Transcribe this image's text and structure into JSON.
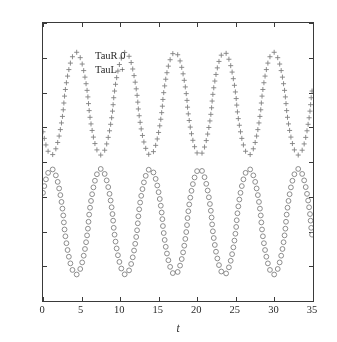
{
  "chart_data": {
    "type": "scatter",
    "title": "",
    "xlabel": "t",
    "ylabel": "",
    "xlim": [
      0,
      35
    ],
    "ylim": [
      -20,
      20
    ],
    "grid": false,
    "legend_position": "top-left",
    "xticks": [
      "0",
      "5",
      "10",
      "15",
      "20",
      "25",
      "30",
      "35"
    ],
    "xtick_values": [
      0,
      5,
      10,
      15,
      20,
      25,
      30,
      35
    ],
    "yticks": [
      "20",
      "15",
      "10",
      "5",
      "0",
      "-5",
      "-10",
      "-15",
      "-20"
    ],
    "ytick_values": [
      20,
      15,
      10,
      5,
      0,
      -5,
      -10,
      -15,
      -20
    ],
    "marker_color": "#808080",
    "axis_color": "#3a3a3a",
    "period": 6.4,
    "series": [
      {
        "name": "TauL",
        "label": "TauL +",
        "marker": "plus",
        "color": "#808080",
        "amplitude_min": 1.0,
        "amplitude_max": 15.8,
        "peaks_t": [
          4.3,
          10.7,
          17.2,
          23.6,
          30.0
        ],
        "troughs_t": [
          1.1,
          7.5,
          13.9,
          20.3,
          26.7,
          33.1
        ],
        "start_value": 5.0,
        "end_value": 11.0
      },
      {
        "name": "TauR",
        "label": "TauR 0",
        "marker": "circle",
        "color": "#808080",
        "amplitude_min": -16.2,
        "amplitude_max": -1.0,
        "peaks_t": [
          1.1,
          7.5,
          13.9,
          20.3,
          26.7,
          33.1
        ],
        "troughs_t": [
          4.3,
          10.7,
          17.2,
          23.6,
          30.0
        ],
        "start_value": -4.5,
        "end_value": -11.0
      }
    ]
  },
  "legend": {
    "taur": "TauR 0",
    "taul": "TauL +"
  },
  "axis": {
    "x_title": "t"
  }
}
